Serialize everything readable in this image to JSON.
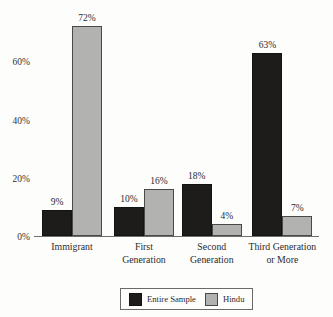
{
  "chart_data": {
    "type": "bar",
    "title": "",
    "subtitle": "",
    "xlabel": "",
    "ylabel": "",
    "ylim": [
      0,
      78
    ],
    "yticks": [
      0,
      20,
      40,
      60
    ],
    "ytick_labels": [
      "0%",
      "20%",
      "40%",
      "60%"
    ],
    "grid": false,
    "legend_position": "bottom-center",
    "value_label_suffix": "%",
    "categories": [
      "Immigrant",
      "First\nGeneration",
      "Second\nGeneration",
      "Third Generation\nor More"
    ],
    "series": [
      {
        "name": "Entire Sample",
        "color": "#1d1c1b",
        "values": [
          9,
          10,
          18,
          63
        ],
        "labels": [
          "9%",
          "10%",
          "18%",
          "63%"
        ]
      },
      {
        "name": "Hindu",
        "color": "#b2b2b0",
        "values": [
          72,
          16,
          4,
          7
        ],
        "labels": [
          "72%",
          "16%",
          "4%",
          "7%"
        ]
      }
    ]
  },
  "legend": {
    "entries": [
      {
        "label": "Entire Sample",
        "swatch": "black-swatch"
      },
      {
        "label": "Hindu",
        "swatch": "gray-swatch"
      }
    ]
  }
}
